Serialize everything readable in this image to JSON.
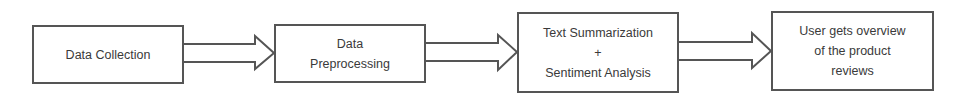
{
  "diagram": {
    "type": "flowchart",
    "direction": "left-to-right",
    "colors": {
      "stroke": "#555555",
      "text": "#3a3a3a",
      "background": "#ffffff"
    },
    "nodes": [
      {
        "id": "data-collection",
        "lines": [
          "Data Collection"
        ]
      },
      {
        "id": "data-preprocessing",
        "lines": [
          "Data",
          "Preprocessing"
        ]
      },
      {
        "id": "text-summarization-sentiment",
        "lines": [
          "Text Summarization",
          "+",
          "Sentiment Analysis"
        ]
      },
      {
        "id": "user-overview",
        "lines": [
          "User gets overview",
          "of the product",
          "reviews"
        ]
      }
    ],
    "edges": [
      {
        "from": "data-collection",
        "to": "data-preprocessing",
        "style": "block-arrow"
      },
      {
        "from": "data-preprocessing",
        "to": "text-summarization-sentiment",
        "style": "block-arrow"
      },
      {
        "from": "text-summarization-sentiment",
        "to": "user-overview",
        "style": "block-arrow"
      }
    ]
  }
}
